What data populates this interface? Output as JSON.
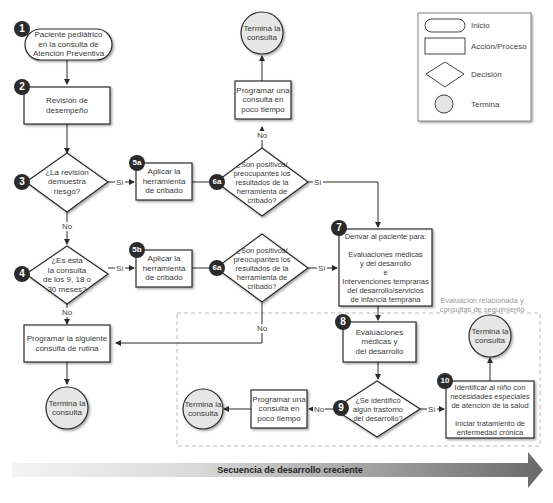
{
  "legend": {
    "items": [
      {
        "shape": "terminator",
        "label": "Inicio"
      },
      {
        "shape": "rectangle",
        "label": "Acción/Proceso"
      },
      {
        "shape": "diamond",
        "label": "Decisión"
      },
      {
        "shape": "circle",
        "label": "Termina"
      }
    ]
  },
  "nodes": {
    "n1": {
      "number": "1",
      "type": "start",
      "text": "Paciente pediátrico\nen la consulta de\nAtención Preventiva"
    },
    "n2": {
      "number": "2",
      "type": "process",
      "text": "Revisión de\ndesempeño"
    },
    "n3": {
      "number": "3",
      "type": "decision",
      "text": "¿La revisión\ndemuestra\nriesgo?"
    },
    "n4": {
      "number": "4",
      "type": "decision",
      "text": "¿Es ésta\nla consulta\nde los 9, 18 o\n30 meses?"
    },
    "n5a": {
      "number": "5a",
      "type": "process",
      "text": "Aplicar la\nherramienta\nde cribado"
    },
    "n5b": {
      "number": "5b",
      "type": "process",
      "text": "Aplicar la\nherramienta\nde cribado"
    },
    "n6a_top": {
      "number": "6a",
      "type": "decision",
      "text": "¿Son positivos/\npreocupantes los\nresultados de la\nherramienta de\ncribado?"
    },
    "n6a_bottom": {
      "number": "6a",
      "type": "decision",
      "text": "¿Son positivos/\npreocupantes los\nresultados de la\nherramienta de\ncribado?"
    },
    "n7": {
      "number": "7",
      "type": "process",
      "text": "Derivar al paciente para:\n\nEvaluaciones médicas\ny del desarrollo\ne\nIntervenciones tempranas\ndel desarrollo/servicios\nde infancia temprana"
    },
    "n8": {
      "number": "8",
      "type": "process",
      "text": "Evaluaciones\nmédicas y\ndel desarrollo"
    },
    "n9": {
      "number": "9",
      "type": "decision",
      "text": "¿Se identificó\nalgún trastorno\ndel desarrollo?"
    },
    "n10": {
      "number": "10",
      "type": "process",
      "text": "Identificar al niño con\nnecesidades especiales\nde atención de la salud\n\nIniciar tratamiento de\nenfermedad crónica"
    },
    "prog_top": {
      "type": "process",
      "text": "Programar una\nconsulta en\npoco tiempo"
    },
    "prog_bottom": {
      "type": "process",
      "text": "Programar una\nconsulta en\npoco tiempo"
    },
    "prog_routine": {
      "type": "process",
      "text": "Programar la siguiente\nconsulta de rutina"
    },
    "end_top": {
      "type": "end",
      "text": "Termina la\nconsulta"
    },
    "end_left": {
      "type": "end",
      "text": "Termina la\nconsulta"
    },
    "end_bottom": {
      "type": "end",
      "text": "Termina la\nconsulta"
    },
    "end_right": {
      "type": "end",
      "text": "Termina la\nconsulta"
    }
  },
  "edge_labels": {
    "yes": "Sí",
    "no": "No"
  },
  "region": {
    "title": "Evaluación relacionada y\nconsultas de seguimiento"
  },
  "footer_arrow": {
    "label": "Secuencia de desarrollo creciente"
  },
  "colors": {
    "stroke": "#2b2b2b",
    "end_fill": "#e6e6e6",
    "dashed_region": "#a8a8a8",
    "arrow_dark": "#6e6e6e",
    "arrow_light": "#f2f2f2"
  }
}
